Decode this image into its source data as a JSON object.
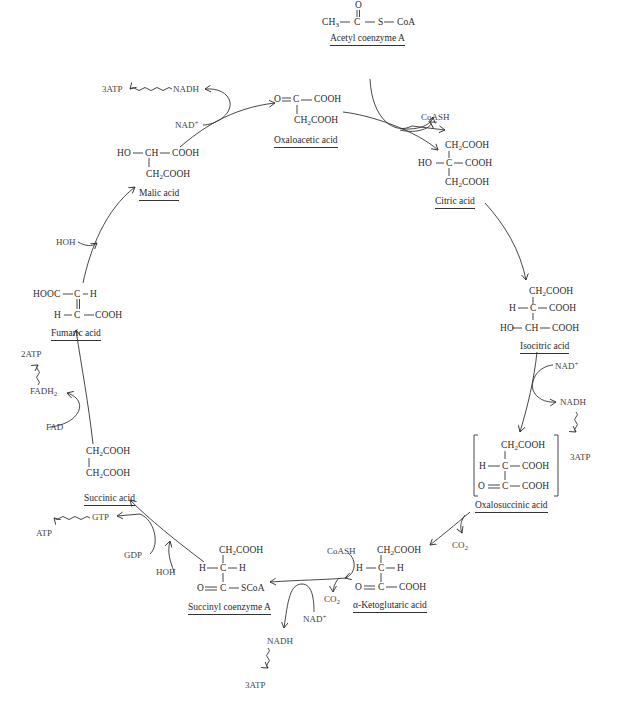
{
  "diagram": {
    "compounds": [
      {
        "id": "acetyl_coa",
        "name": "Acetyl coenzyme A",
        "formula": "CH3-C(=O)-S-CoA"
      },
      {
        "id": "oxaloacetic",
        "name": "Oxaloacetic acid",
        "formula": "O=C(COOH)-CH2COOH"
      },
      {
        "id": "citric",
        "name": "Citric acid",
        "formula": "HO-C(CH2COOH)(COOH)-CH2COOH"
      },
      {
        "id": "isocitric",
        "name": "Isocitric acid",
        "formula": "CH2COOH / H-C-COOH / HO-CH-COOH"
      },
      {
        "id": "oxalosuccinic",
        "name": "Oxalosuccinic acid",
        "formula": "[CH2COOH / H-C-COOH / O=C-COOH]"
      },
      {
        "id": "ketoglutaric",
        "name": "α-Ketoglutaric acid",
        "formula": "CH2COOH / H-C-H / O=C-COOH"
      },
      {
        "id": "succinyl_coa",
        "name": "Succinyl coenzyme A",
        "formula": "CH2COOH / H-C-H / O=C-SCoA"
      },
      {
        "id": "succinic",
        "name": "Succinic acid",
        "formula": "CH2COOH / CH2COOH"
      },
      {
        "id": "fumaric",
        "name": "Fumaric acid",
        "formula": "HOOC-C-H // H-C-COOH"
      },
      {
        "id": "malic",
        "name": "Malic acid",
        "formula": "HO-CH-COOH / CH2COOH"
      }
    ],
    "labels": {
      "acetyl_coa": "Acetyl coenzyme A",
      "oxaloacetic": "Oxaloacetic acid",
      "citric": "Citric acid",
      "isocitric": "Isocitric acid",
      "oxalosuccinic": "Oxalosuccinic acid",
      "ketoglutaric": "α-Ketoglutaric acid",
      "succinyl_coa": "Succinyl coenzyme A",
      "succinic": "Succinic acid",
      "fumaric": "Fumaric acid",
      "malic": "Malic acid"
    },
    "atoms": {
      "O": "O",
      "C": "C",
      "H": "H",
      "S": "S",
      "CoA": "CoA",
      "SCoA": "SCoA",
      "CH3": "CH",
      "CH": "CH",
      "HO": "HO",
      "HOOC": "HOOC",
      "COOH": "COOH",
      "CH2COOH_a": "CH",
      "CH2COOH_b": "COOH"
    },
    "cofactors": {
      "coash_1": "CoASH",
      "nad_malic": "NAD",
      "nadh_malic": "NADH",
      "atp_malic": "3ATP",
      "hoh_fumaric": "HOH",
      "fadh2": "FADH",
      "fad": "FAD",
      "atp_fad": "2ATP",
      "gtp": "GTP",
      "gdp": "GDP",
      "atp_gtp": "ATP",
      "hoh_succinyl": "HOH",
      "nad_iso": "NAD",
      "nadh_iso": "NADH",
      "atp_iso": "3ATP",
      "co2_oxalo": "CO",
      "coash_2": "CoASH",
      "co2_keto": "CO",
      "nad_keto": "NAD",
      "nadh_keto": "NADH",
      "atp_keto": "3ATP"
    },
    "super_plus": "+",
    "sub_2": "2",
    "sub_3": "3"
  }
}
